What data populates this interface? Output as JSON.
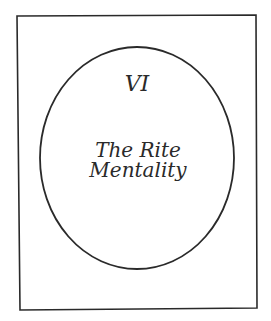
{
  "chapter": {
    "number": "VI",
    "title_lines": [
      "The Rite",
      "Mentality"
    ]
  },
  "style": {
    "ink_color": "#2a2a2a",
    "background_color": "#ffffff"
  }
}
